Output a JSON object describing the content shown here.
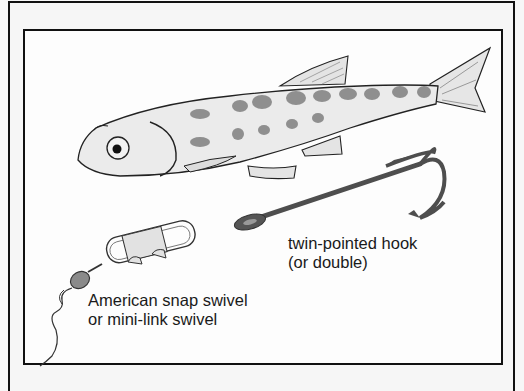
{
  "figure": {
    "type": "illustration",
    "items": [
      {
        "id": "fish",
        "name": "baitfish",
        "labeled": false
      },
      {
        "id": "hook",
        "name": "twin-pointed hook"
      },
      {
        "id": "swivel",
        "name": "snap swivel"
      }
    ]
  },
  "labels": {
    "hook": {
      "line1": "twin-pointed hook",
      "line2": "(or double)"
    },
    "swivel": {
      "line1": "American snap swivel",
      "line2": "or mini-link swivel"
    }
  },
  "colors": {
    "frame": "#111111",
    "background": "#fdfdfd",
    "fish_body": "#e8e8e8",
    "fish_markings": "#555555",
    "hook": "#5a5a5a",
    "swivel_barrel": "#8a8a8a",
    "text": "#1a1a1a"
  }
}
